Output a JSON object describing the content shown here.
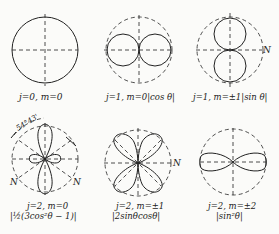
{
  "figure": {
    "panels": [
      {
        "id": "p1",
        "label_line1": "j=0, m=0",
        "label_line2": "",
        "pattern": "sphere"
      },
      {
        "id": "p2",
        "label_line1": "j=1,  m=0|cos θ|",
        "label_line2": "",
        "pattern": "cos"
      },
      {
        "id": "p3",
        "label_line1": "j=1, m=±1|sin θ|",
        "label_line2": "",
        "pattern": "sin",
        "marker": "N"
      },
      {
        "id": "p4",
        "label_line1": "j=2, m=0",
        "label_line2": "|½(3cos²θ − 1)|",
        "pattern": "3cos2-1",
        "angle_annotation": "54°43'",
        "markers": [
          "N",
          "N"
        ]
      },
      {
        "id": "p5",
        "label_line1": "j=2, m=±1",
        "label_line2": "|2sinθcosθ|",
        "pattern": "sincos",
        "marker": "N"
      },
      {
        "id": "p6",
        "label_line1": "j=2, m=±2",
        "label_line2": "|sin²θ|",
        "pattern": "sin2"
      }
    ]
  },
  "colors": {
    "ink": "#222222",
    "paper": "#fbfbf9"
  }
}
